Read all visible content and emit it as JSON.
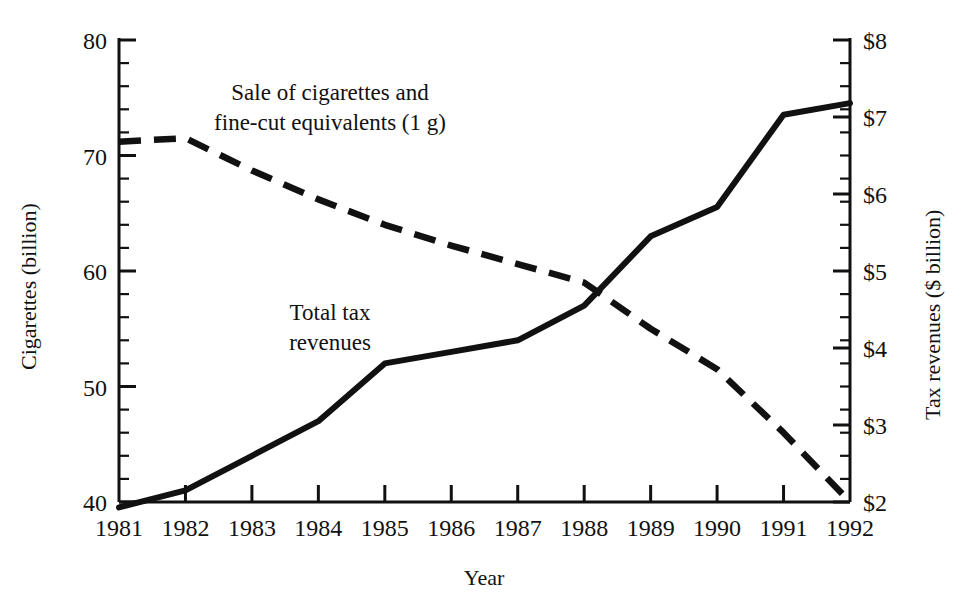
{
  "chart_data": {
    "type": "line",
    "title": "",
    "xlabel": "Year",
    "ylabel": "Cigarettes (billion)",
    "y2label": "Tax revenues ($ billion)",
    "x": [
      1981,
      1982,
      1983,
      1984,
      1985,
      1986,
      1987,
      1988,
      1989,
      1990,
      1991,
      1992
    ],
    "categories": [
      "1981",
      "1982",
      "1983",
      "1984",
      "1985",
      "1986",
      "1987",
      "1988",
      "1989",
      "1990",
      "1991",
      "1992"
    ],
    "xlim": [
      1981,
      1992
    ],
    "ylim": [
      40,
      80
    ],
    "y2lim": [
      2,
      8
    ],
    "ytick_labels": [
      "40",
      "50",
      "60",
      "70",
      "80"
    ],
    "ytick_values": [
      40,
      50,
      60,
      70,
      80
    ],
    "y_minor_step": 2,
    "y2tick_labels": [
      "$2",
      "$3",
      "$4",
      "$5",
      "$6",
      "$7",
      "$8"
    ],
    "y2tick_values": [
      2,
      3,
      4,
      5,
      6,
      7,
      8
    ],
    "y2_minor_step": 0.3,
    "grid": false,
    "legend_position": "inline-annotations",
    "series": [
      {
        "name": "Sale of cigarettes and fine-cut equivalents (1 g)",
        "axis": "left",
        "style": "dashed",
        "units": "billion cigarettes",
        "values": [
          71.2,
          71.5,
          68.7,
          66.2,
          64.0,
          62.2,
          60.6,
          59.0,
          55.0,
          51.5,
          46.0,
          40.0
        ]
      },
      {
        "name": "Total tax revenues",
        "axis": "right",
        "style": "solid",
        "units": "$ billion",
        "values": [
          1.93,
          2.15,
          2.6,
          3.05,
          3.8,
          3.95,
          4.1,
          4.55,
          5.45,
          5.83,
          7.03,
          7.18
        ]
      }
    ],
    "annotations": [
      {
        "id": "annot-cigarette-sales",
        "line1": "Sale of cigarettes and",
        "line2": "fine-cut equivalents (1 g)",
        "x": 330,
        "y": 100
      },
      {
        "id": "annot-tax-revenues",
        "line1": "Total tax",
        "line2": "revenues",
        "x": 330,
        "y": 320
      }
    ],
    "colors": {
      "line": "#111111",
      "axis": "#111111",
      "background": "#ffffff"
    }
  }
}
